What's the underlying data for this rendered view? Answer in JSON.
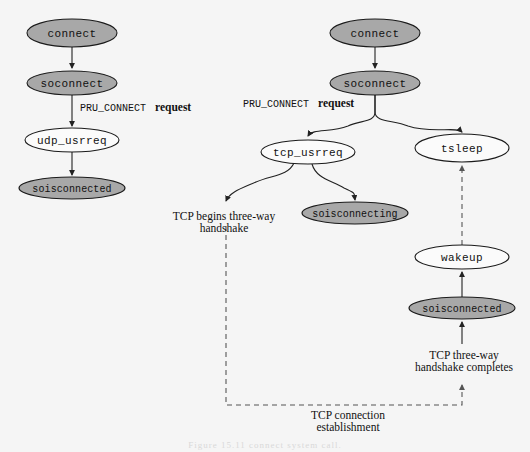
{
  "diagram": {
    "background_color": "#f5f5f5",
    "shaded_fill": "#a8a8a8",
    "plain_fill": "#fbfbfb",
    "stroke_color": "#1a1a1a",
    "caption": "Figure 15.11  connect system call.",
    "nodes": [
      {
        "id": "udp_connect",
        "label": "connect",
        "shaded": true,
        "cx": 72,
        "cy": 33,
        "rx": 45,
        "ry": 14
      },
      {
        "id": "udp_soconnect",
        "label": "soconnect",
        "shaded": true,
        "cx": 72,
        "cy": 83,
        "rx": 45,
        "ry": 12
      },
      {
        "id": "udp_usrreq",
        "label": "udp_usrreq",
        "shaded": false,
        "cx": 72,
        "cy": 140,
        "rx": 47,
        "ry": 12
      },
      {
        "id": "udp_soisconnected",
        "label": "soisconnected",
        "shaded": true,
        "cx": 72,
        "cy": 188,
        "rx": 53,
        "ry": 11
      },
      {
        "id": "tcp_connect",
        "label": "connect",
        "shaded": true,
        "cx": 375,
        "cy": 33,
        "rx": 45,
        "ry": 14
      },
      {
        "id": "tcp_soconnect",
        "label": "soconnect",
        "shaded": true,
        "cx": 375,
        "cy": 83,
        "rx": 45,
        "ry": 12
      },
      {
        "id": "tcp_usrreq",
        "label": "tcp_usrreq",
        "shaded": false,
        "cx": 308,
        "cy": 152,
        "rx": 47,
        "ry": 12
      },
      {
        "id": "tsleep",
        "label": "tsleep",
        "shaded": false,
        "cx": 462,
        "cy": 148,
        "rx": 47,
        "ry": 14
      },
      {
        "id": "soisconnecting",
        "label": "soisconnecting",
        "shaded": true,
        "cx": 355,
        "cy": 213,
        "rx": 53,
        "ry": 11
      },
      {
        "id": "wakeup",
        "label": "wakeup",
        "shaded": false,
        "cx": 462,
        "cy": 257,
        "rx": 47,
        "ry": 12
      },
      {
        "id": "tcp_soisconnected",
        "label": "soisconnected",
        "shaded": true,
        "cx": 462,
        "cy": 308,
        "rx": 53,
        "ry": 11
      }
    ],
    "edge_labels": [
      {
        "id": "udp_pru_connect",
        "mono": "PRU_CONNECT",
        "bold": "request",
        "x": 80,
        "y": 111
      },
      {
        "id": "tcp_pru_connect",
        "mono": "PRU_CONNECT",
        "bold": "request",
        "x": 243,
        "y": 107
      }
    ],
    "text_labels": [
      {
        "id": "tcp-begins-handshake",
        "lines": [
          "TCP begins three-way",
          "handshake"
        ],
        "cx": 224,
        "y": 217
      },
      {
        "id": "tcp-handshake-completes",
        "lines": [
          "TCP three-way",
          "handshake completes"
        ],
        "cx": 464,
        "y": 359
      },
      {
        "id": "tcp-connection-establishment",
        "lines": [
          "TCP connection",
          "establishment"
        ],
        "cx": 348,
        "y": 419
      }
    ]
  }
}
